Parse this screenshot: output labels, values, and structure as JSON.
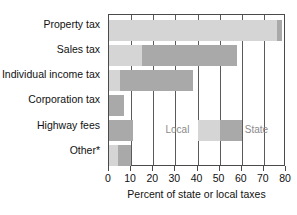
{
  "chart_data": {
    "type": "bar",
    "orientation": "horizontal",
    "stacked": true,
    "title": "",
    "xlabel": "Percent of state or local taxes",
    "ylabel": "",
    "xlim": [
      0,
      80
    ],
    "xticks": [
      0,
      10,
      20,
      30,
      40,
      50,
      60,
      70,
      80
    ],
    "xtick_labels": [
      "0",
      "10",
      "20",
      "30",
      "40",
      "50",
      "60",
      "70",
      "80"
    ],
    "grid": true,
    "grid_axis": "x",
    "legend_position": "inside-center-right",
    "categories": [
      "Property tax",
      "Sales tax",
      "Individual income tax",
      "Corporation tax",
      "Highway fees",
      "Other*"
    ],
    "series": [
      {
        "name": "Local",
        "color": "#d5d5d5",
        "values": [
          76,
          15,
          5,
          0,
          0,
          4
        ]
      },
      {
        "name": "State",
        "color": "#a9a9a9",
        "values": [
          2,
          43,
          33,
          7,
          11,
          6
        ]
      }
    ],
    "bar_totals": [
      78,
      58,
      38,
      7,
      11,
      10
    ],
    "legend_entries": [
      {
        "label": "Local",
        "color": "#d5d5d5"
      },
      {
        "label": "State",
        "color": "#a9a9a9"
      }
    ]
  },
  "axis": {
    "x_title": "Percent of state or local taxes",
    "ticks": [
      "0",
      "10",
      "20",
      "30",
      "40",
      "50",
      "60",
      "70",
      "80"
    ]
  },
  "categories": {
    "0": "Property tax",
    "1": "Sales tax",
    "2": "Individual income tax",
    "3": "Corporation tax",
    "4": "Highway fees",
    "5": "Other*"
  },
  "legend": {
    "local_label": "Local",
    "state_label": "State"
  },
  "colors": {
    "local": "#d5d5d5",
    "state": "#a9a9a9",
    "axis": "#4a4a4a",
    "grid": "#5a5a5a",
    "legend_text": "#8a8a8a",
    "text": "#111111",
    "background": "#ffffff"
  }
}
